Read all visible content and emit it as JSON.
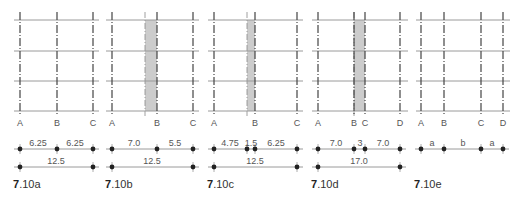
{
  "figure": {
    "grid_rows_y": [
      20,
      51,
      81,
      111
    ],
    "axis_label_y": 122,
    "dim_row1_y": 149,
    "dim_row2_y": 167,
    "colors": {
      "grid_line": "#9a9a9a",
      "axis_line": "#444444",
      "band_fill": "#cccccc",
      "band_edge": "#888888",
      "dot": "#222222",
      "text": "#555555"
    },
    "panels": [
      {
        "id": "7.10a",
        "caption_bold": "7",
        "caption_rest": ".10a",
        "x_range": [
          14,
          99
        ],
        "axes": [
          {
            "label": "A",
            "x": 20
          },
          {
            "label": "B",
            "x": 57
          },
          {
            "label": "C",
            "x": 93
          }
        ],
        "band": null,
        "dims_row1": {
          "points": [
            20,
            57,
            93
          ],
          "labels": [
            {
              "text": "6.25",
              "x": 38
            },
            {
              "text": "6.25",
              "x": 75
            }
          ]
        },
        "dims_row2": {
          "points": [
            20,
            93
          ],
          "labels": [
            {
              "text": "12.5",
              "x": 56
            }
          ]
        }
      },
      {
        "id": "7.10b",
        "caption_bold": "7",
        "caption_rest": ".10b",
        "x_range": [
          106,
          199
        ],
        "axes": [
          {
            "label": "A",
            "x": 112
          },
          {
            "label": "B",
            "x": 157
          },
          {
            "label": "C",
            "x": 193
          }
        ],
        "band": {
          "x1": 145,
          "x2": 157
        },
        "dims_row1": {
          "points": [
            112,
            157,
            193
          ],
          "labels": [
            {
              "text": "7.0",
              "x": 134
            },
            {
              "text": "5.5",
              "x": 175
            }
          ]
        },
        "dims_row2": {
          "points": [
            112,
            193
          ],
          "labels": [
            {
              "text": "12.5",
              "x": 152
            }
          ]
        }
      },
      {
        "id": "7.10c",
        "caption_bold": "7",
        "caption_rest": ".10c",
        "x_range": [
          208,
          303
        ],
        "axes": [
          {
            "label": "A",
            "x": 214
          },
          {
            "label": "B",
            "x": 255
          },
          {
            "label": "C",
            "x": 297
          }
        ],
        "band": {
          "x1": 247,
          "x2": 255
        },
        "dims_row1": {
          "points": [
            214,
            247,
            255,
            297
          ],
          "labels": [
            {
              "text": "4.75",
              "x": 230
            },
            {
              "text": "1.5",
              "x": 251
            },
            {
              "text": "6.25",
              "x": 276
            }
          ]
        },
        "dims_row2": {
          "points": [
            214,
            297
          ],
          "labels": [
            {
              "text": "12.5",
              "x": 255
            }
          ]
        }
      },
      {
        "id": "7.10d",
        "caption_bold": "7",
        "caption_rest": ".10d",
        "x_range": [
          312,
          408
        ],
        "axes": [
          {
            "label": "A",
            "x": 318
          },
          {
            "label": "B",
            "x": 354
          },
          {
            "label": "C",
            "x": 365
          },
          {
            "label": "D",
            "x": 400
          }
        ],
        "band": {
          "x1": 354,
          "x2": 365
        },
        "dims_row1": {
          "points": [
            318,
            354,
            365,
            400
          ],
          "labels": [
            {
              "text": "7.0",
              "x": 336
            },
            {
              "text": "3",
              "x": 360
            },
            {
              "text": "7.0",
              "x": 383
            }
          ]
        },
        "dims_row2": {
          "points": [
            318,
            400
          ],
          "labels": [
            {
              "text": "17.0",
              "x": 359
            }
          ]
        }
      },
      {
        "id": "7.10e",
        "caption_bold": "7",
        "caption_rest": ".10e",
        "x_range": [
          416,
          510
        ],
        "axes": [
          {
            "label": "A",
            "x": 421
          },
          {
            "label": "B",
            "x": 444
          },
          {
            "label": "C",
            "x": 481
          },
          {
            "label": "D",
            "x": 503
          }
        ],
        "band": null,
        "dims_row1": {
          "points": [
            421,
            444,
            481,
            503
          ],
          "labels": [
            {
              "text": "a",
              "x": 432
            },
            {
              "text": "b",
              "x": 463
            },
            {
              "text": "a",
              "x": 492
            }
          ]
        },
        "dims_row2": null
      }
    ]
  }
}
